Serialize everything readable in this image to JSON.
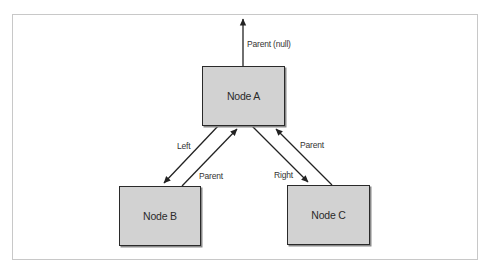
{
  "diagram": {
    "type": "binary-tree-node-links",
    "nodes": [
      {
        "id": "A",
        "label": "Node A"
      },
      {
        "id": "B",
        "label": "Node B"
      },
      {
        "id": "C",
        "label": "Node C"
      }
    ],
    "edges": [
      {
        "from": "A",
        "to": "null",
        "label": "Parent (null)"
      },
      {
        "from": "A",
        "to": "B",
        "label": "Left"
      },
      {
        "from": "B",
        "to": "A",
        "label": "Parent"
      },
      {
        "from": "A",
        "to": "C",
        "label": "Right"
      },
      {
        "from": "C",
        "to": "A",
        "label": "Parent"
      }
    ],
    "colors": {
      "node_fill": "#d2d2d2",
      "node_border": "#2a2a2a",
      "line": "#222222",
      "frame": "#c8c8c8"
    }
  }
}
